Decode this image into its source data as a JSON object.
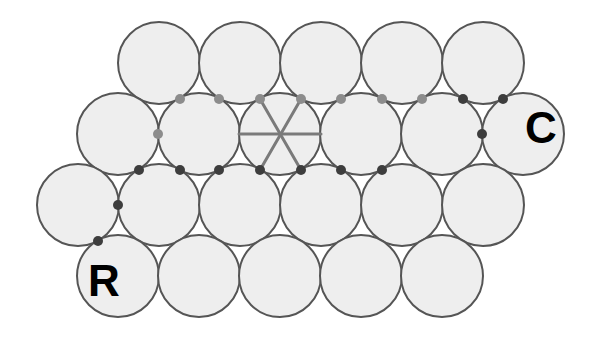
{
  "figure": {
    "name": "hexagonal-close-packing-diagram",
    "width": 615,
    "height": 360,
    "background_color": "#ffffff"
  },
  "style": {
    "circle_fill": "#eeeeee",
    "circle_stroke": "#555555",
    "circle_stroke_width": 2,
    "circle_radius": 41,
    "light_dot_color": "#8c8c8c",
    "dark_dot_color": "#3d3d3d",
    "dot_radius": 5,
    "lattice_line_color": "#7a7a7a",
    "lattice_line_width": 3,
    "label_color": "#000000",
    "label_font_size": 44
  },
  "labels": [
    {
      "id": "label-c",
      "text": "C",
      "x": 541,
      "y": 131
    },
    {
      "id": "label-r",
      "text": "R",
      "x": 104,
      "y": 284
    }
  ],
  "circles": [
    {
      "id": "row1-c1",
      "row": 1,
      "col": 1,
      "cx": 159,
      "cy": 63
    },
    {
      "id": "row1-c2",
      "row": 1,
      "col": 2,
      "cx": 240,
      "cy": 63
    },
    {
      "id": "row1-c3",
      "row": 1,
      "col": 3,
      "cx": 321,
      "cy": 63
    },
    {
      "id": "row1-c4",
      "row": 1,
      "col": 4,
      "cx": 402,
      "cy": 63
    },
    {
      "id": "row1-c5",
      "row": 1,
      "col": 5,
      "cx": 483,
      "cy": 63
    },
    {
      "id": "row2-c1",
      "row": 2,
      "col": 1,
      "cx": 118,
      "cy": 134
    },
    {
      "id": "row2-c2",
      "row": 2,
      "col": 2,
      "cx": 199,
      "cy": 134
    },
    {
      "id": "row2-c3",
      "row": 2,
      "col": 3,
      "cx": 280,
      "cy": 134
    },
    {
      "id": "row2-c4",
      "row": 2,
      "col": 4,
      "cx": 361,
      "cy": 134
    },
    {
      "id": "row2-c5",
      "row": 2,
      "col": 5,
      "cx": 442,
      "cy": 134
    },
    {
      "id": "row2-c6",
      "row": 2,
      "col": 6,
      "cx": 523,
      "cy": 134
    },
    {
      "id": "row3-c1",
      "row": 3,
      "col": 1,
      "cx": 78,
      "cy": 205
    },
    {
      "id": "row3-c2",
      "row": 3,
      "col": 2,
      "cx": 159,
      "cy": 205
    },
    {
      "id": "row3-c3",
      "row": 3,
      "col": 3,
      "cx": 240,
      "cy": 205
    },
    {
      "id": "row3-c4",
      "row": 3,
      "col": 4,
      "cx": 321,
      "cy": 205
    },
    {
      "id": "row3-c5",
      "row": 3,
      "col": 5,
      "cx": 402,
      "cy": 205
    },
    {
      "id": "row3-c6",
      "row": 3,
      "col": 6,
      "cx": 483,
      "cy": 205
    },
    {
      "id": "row4-c1",
      "row": 4,
      "col": 1,
      "cx": 118,
      "cy": 276
    },
    {
      "id": "row4-c2",
      "row": 4,
      "col": 2,
      "cx": 199,
      "cy": 276
    },
    {
      "id": "row4-c3",
      "row": 4,
      "col": 3,
      "cx": 280,
      "cy": 276
    },
    {
      "id": "row4-c4",
      "row": 4,
      "col": 4,
      "cx": 361,
      "cy": 276
    },
    {
      "id": "row4-c5",
      "row": 4,
      "col": 5,
      "cx": 442,
      "cy": 276
    }
  ],
  "center_circle_id": "row2-c3",
  "star_lines": [
    {
      "id": "star-line-horizontal",
      "x1": 239,
      "y1": 134,
      "x2": 321,
      "y2": 134
    },
    {
      "id": "star-line-60deg",
      "x1": 260,
      "y1": 99,
      "x2": 301,
      "y2": 170
    },
    {
      "id": "star-line-120deg",
      "x1": 301,
      "y1": 99,
      "x2": 260,
      "y2": 170
    }
  ],
  "contact_dots": [
    {
      "id": "dot-upper-1",
      "cx": 180,
      "cy": 99,
      "shade": "light"
    },
    {
      "id": "dot-upper-2",
      "cx": 219,
      "cy": 99,
      "shade": "light"
    },
    {
      "id": "dot-upper-3",
      "cx": 260,
      "cy": 99,
      "shade": "light"
    },
    {
      "id": "dot-upper-4",
      "cx": 301,
      "cy": 99,
      "shade": "light"
    },
    {
      "id": "dot-upper-5",
      "cx": 341,
      "cy": 99,
      "shade": "light"
    },
    {
      "id": "dot-upper-6",
      "cx": 382,
      "cy": 99,
      "shade": "light"
    },
    {
      "id": "dot-upper-7",
      "cx": 422,
      "cy": 99,
      "shade": "light"
    },
    {
      "id": "dot-upper-8",
      "cx": 463,
      "cy": 99,
      "shade": "dark"
    },
    {
      "id": "dot-upper-9",
      "cx": 503,
      "cy": 99,
      "shade": "dark"
    },
    {
      "id": "dot-mid-left",
      "cx": 158,
      "cy": 134,
      "shade": "light"
    },
    {
      "id": "dot-mid-right",
      "cx": 482,
      "cy": 134,
      "shade": "dark"
    },
    {
      "id": "dot-lower-1",
      "cx": 139,
      "cy": 170,
      "shade": "dark"
    },
    {
      "id": "dot-lower-2",
      "cx": 180,
      "cy": 170,
      "shade": "dark"
    },
    {
      "id": "dot-lower-3",
      "cx": 219,
      "cy": 170,
      "shade": "dark"
    },
    {
      "id": "dot-lower-4",
      "cx": 260,
      "cy": 170,
      "shade": "dark"
    },
    {
      "id": "dot-lower-5",
      "cx": 301,
      "cy": 170,
      "shade": "dark"
    },
    {
      "id": "dot-lower-6",
      "cx": 341,
      "cy": 170,
      "shade": "dark"
    },
    {
      "id": "dot-lower-7",
      "cx": 382,
      "cy": 170,
      "shade": "dark"
    },
    {
      "id": "dot-edge-1",
      "cx": 118,
      "cy": 205,
      "shade": "dark"
    },
    {
      "id": "dot-edge-2",
      "cx": 98,
      "cy": 241,
      "shade": "dark"
    }
  ]
}
